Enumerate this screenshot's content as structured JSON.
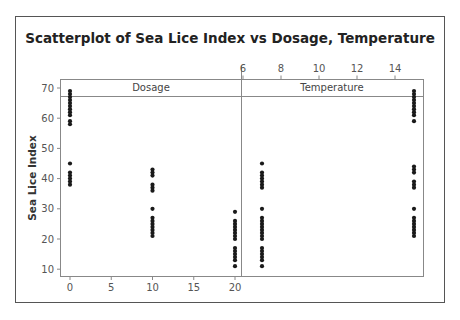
{
  "chart_data": {
    "type": "scatter",
    "title": "Scatterplot of Sea Lice Index vs Dosage, Temperature",
    "ylabel": "Sea Lice Index",
    "ylim": [
      8,
      73
    ],
    "yticks": [
      10,
      20,
      30,
      40,
      50,
      60,
      70
    ],
    "grid": false,
    "legend": null,
    "panels": [
      {
        "name": "Dosage",
        "xlabel": "Dosage",
        "xaxis_position": "bottom",
        "xlim": [
          -1,
          21
        ],
        "xticks": [
          0,
          5,
          10,
          15,
          20
        ],
        "points": [
          {
            "x": 0,
            "y": 69
          },
          {
            "x": 0,
            "y": 68
          },
          {
            "x": 0,
            "y": 67
          },
          {
            "x": 0,
            "y": 66
          },
          {
            "x": 0,
            "y": 65
          },
          {
            "x": 0,
            "y": 64
          },
          {
            "x": 0,
            "y": 63
          },
          {
            "x": 0,
            "y": 62
          },
          {
            "x": 0,
            "y": 61
          },
          {
            "x": 0,
            "y": 59
          },
          {
            "x": 0,
            "y": 58
          },
          {
            "x": 0,
            "y": 45
          },
          {
            "x": 0,
            "y": 42
          },
          {
            "x": 0,
            "y": 41
          },
          {
            "x": 0,
            "y": 40
          },
          {
            "x": 0,
            "y": 39
          },
          {
            "x": 0,
            "y": 38
          },
          {
            "x": 10,
            "y": 43
          },
          {
            "x": 10,
            "y": 42
          },
          {
            "x": 10,
            "y": 41
          },
          {
            "x": 10,
            "y": 38
          },
          {
            "x": 10,
            "y": 37
          },
          {
            "x": 10,
            "y": 36
          },
          {
            "x": 10,
            "y": 30
          },
          {
            "x": 10,
            "y": 27
          },
          {
            "x": 10,
            "y": 26
          },
          {
            "x": 10,
            "y": 25
          },
          {
            "x": 10,
            "y": 24
          },
          {
            "x": 10,
            "y": 23
          },
          {
            "x": 10,
            "y": 22
          },
          {
            "x": 10,
            "y": 21
          },
          {
            "x": 20,
            "y": 29
          },
          {
            "x": 20,
            "y": 26
          },
          {
            "x": 20,
            "y": 25
          },
          {
            "x": 20,
            "y": 24
          },
          {
            "x": 20,
            "y": 23
          },
          {
            "x": 20,
            "y": 22
          },
          {
            "x": 20,
            "y": 21
          },
          {
            "x": 20,
            "y": 20
          },
          {
            "x": 20,
            "y": 17
          },
          {
            "x": 20,
            "y": 16
          },
          {
            "x": 20,
            "y": 15
          },
          {
            "x": 20,
            "y": 14
          },
          {
            "x": 20,
            "y": 13
          },
          {
            "x": 20,
            "y": 11
          }
        ]
      },
      {
        "name": "Temperature",
        "xlabel": "Temperature",
        "xaxis_position": "top",
        "xlim": [
          6,
          15.5
        ],
        "xticks": [
          6,
          8,
          10,
          12,
          14
        ],
        "points": [
          {
            "x": 7,
            "y": 45
          },
          {
            "x": 7,
            "y": 42
          },
          {
            "x": 7,
            "y": 41
          },
          {
            "x": 7,
            "y": 40
          },
          {
            "x": 7,
            "y": 39
          },
          {
            "x": 7,
            "y": 38
          },
          {
            "x": 7,
            "y": 37
          },
          {
            "x": 7,
            "y": 30
          },
          {
            "x": 7,
            "y": 27
          },
          {
            "x": 7,
            "y": 26
          },
          {
            "x": 7,
            "y": 25
          },
          {
            "x": 7,
            "y": 24
          },
          {
            "x": 7,
            "y": 23
          },
          {
            "x": 7,
            "y": 22
          },
          {
            "x": 7,
            "y": 21
          },
          {
            "x": 7,
            "y": 20
          },
          {
            "x": 7,
            "y": 17
          },
          {
            "x": 7,
            "y": 16
          },
          {
            "x": 7,
            "y": 15
          },
          {
            "x": 7,
            "y": 14
          },
          {
            "x": 7,
            "y": 13
          },
          {
            "x": 7,
            "y": 11
          },
          {
            "x": 15,
            "y": 69
          },
          {
            "x": 15,
            "y": 68
          },
          {
            "x": 15,
            "y": 67
          },
          {
            "x": 15,
            "y": 66
          },
          {
            "x": 15,
            "y": 65
          },
          {
            "x": 15,
            "y": 64
          },
          {
            "x": 15,
            "y": 63
          },
          {
            "x": 15,
            "y": 62
          },
          {
            "x": 15,
            "y": 61
          },
          {
            "x": 15,
            "y": 59
          },
          {
            "x": 15,
            "y": 44
          },
          {
            "x": 15,
            "y": 43
          },
          {
            "x": 15,
            "y": 42
          },
          {
            "x": 15,
            "y": 39
          },
          {
            "x": 15,
            "y": 38
          },
          {
            "x": 15,
            "y": 37
          },
          {
            "x": 15,
            "y": 30
          },
          {
            "x": 15,
            "y": 27
          },
          {
            "x": 15,
            "y": 26
          },
          {
            "x": 15,
            "y": 25
          },
          {
            "x": 15,
            "y": 24
          },
          {
            "x": 15,
            "y": 23
          },
          {
            "x": 15,
            "y": 22
          },
          {
            "x": 15,
            "y": 21
          }
        ]
      }
    ]
  },
  "colors": {
    "frame": "#555555",
    "axis": "#888888",
    "marker": "#1a1a1a"
  }
}
